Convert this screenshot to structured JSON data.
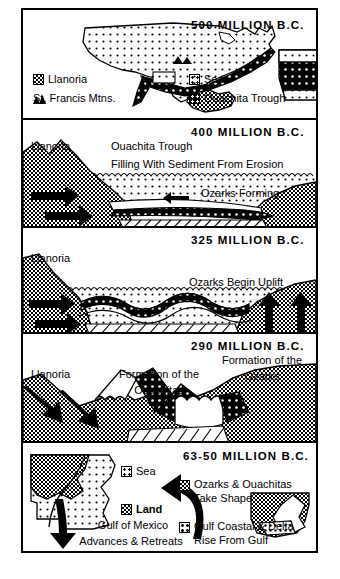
{
  "figure": {
    "accent_color": "#000000",
    "background_color": "#ffffff"
  },
  "panels": [
    {
      "id": "panel-500",
      "era": "500  MILLION  B.C.",
      "legend": [
        {
          "swatch": "gray-stipple",
          "label": "Llanoria"
        },
        {
          "swatch": "mountain-triangles",
          "label": "St. Francis Mtns."
        },
        {
          "swatch": "sea-dots",
          "label": "Sea"
        },
        {
          "swatch": "dark-trough",
          "label": "Ouachita Trough"
        }
      ],
      "maps": [
        {
          "name": "united-states-map",
          "fills": [
            "Sea",
            "Ouachita Trough",
            "Llanoria",
            "St. Francis Mtns."
          ]
        },
        {
          "name": "arkansas-inset-map",
          "fills": [
            "Sea",
            "Ouachita Trough"
          ]
        }
      ]
    },
    {
      "id": "panel-400",
      "era": "400  MILLION  B.C.",
      "labels": [
        {
          "name": "llanoria-label",
          "text": "Llanoria"
        },
        {
          "name": "trough-label-line1",
          "text": "Ouachita Trough"
        },
        {
          "name": "trough-label-line2",
          "text": "Filling With Sediment From Erosion"
        },
        {
          "name": "ozarks-forming-label",
          "text": "Ozarks Forming"
        }
      ]
    },
    {
      "id": "panel-325",
      "era": "325  MILLION  B.C.",
      "labels": [
        {
          "name": "llanoria-label",
          "text": "Llanoria"
        },
        {
          "name": "ozarks-uplift-label",
          "text": "Ozarks Begin Uplift"
        }
      ]
    },
    {
      "id": "panel-290",
      "era": "290  MILLION  B.C.",
      "labels": [
        {
          "name": "llanoria-label",
          "text": "Llanoria"
        },
        {
          "name": "ouachitas-label-line1",
          "text": "Formation of the"
        },
        {
          "name": "ouachitas-label-line2",
          "text": "Ouachitas"
        },
        {
          "name": "ozarks-label-line1",
          "text": "Formation of the"
        },
        {
          "name": "ozarks-label-line2",
          "text": "Ozarks"
        }
      ]
    },
    {
      "id": "panel-63-50",
      "era": "63-50  MILLION  B.C.",
      "legend": [
        {
          "swatch": "sea-dots",
          "label": "Sea"
        },
        {
          "swatch": "gray-stipple",
          "label": "Land"
        },
        {
          "swatch": "gray-stipple",
          "label": "Ozarks & Ouachitas\nTake Shape"
        },
        {
          "swatch": "delta-dots",
          "label": "Gulf Coastal & Delta\nRise From Gulf"
        }
      ],
      "legend_flat": {
        "sea": "Sea",
        "land": "Land",
        "ozarks_line1": "Ozarks & Ouachitas",
        "ozarks_line2": "Take Shape",
        "gulf_line1": "Gulf Coastal & Delta",
        "gulf_line2": "Rise From Gulf"
      },
      "labels": [
        {
          "name": "gulf-label-line1",
          "text": "Gulf of Mexico"
        },
        {
          "name": "gulf-label-line2",
          "text": "Advances & Retreats"
        }
      ],
      "maps": [
        {
          "name": "gulf-coast-map",
          "fills": [
            "Land",
            "Sea"
          ]
        },
        {
          "name": "arkansas-inset-map",
          "fills": [
            "Ozarks & Ouachitas",
            "Gulf Coastal & Delta"
          ]
        }
      ]
    }
  ],
  "panel1": {
    "era": "500  MILLION  B.C.",
    "legend": {
      "llanoria": "Llanoria",
      "st_francis": "St. Francis Mtns.",
      "sea": "Sea",
      "trough": "Ouachita Trough"
    }
  },
  "panel2": {
    "era": "400  MILLION  B.C.",
    "llanoria": "Llanoria",
    "trough1": "Ouachita Trough",
    "trough2": "Filling With Sediment From Erosion",
    "ozarks": "Ozarks Forming"
  },
  "panel3": {
    "era": "325  MILLION  B.C.",
    "llanoria": "Llanoria",
    "uplift": "Ozarks Begin Uplift"
  },
  "panel4": {
    "era": "290  MILLION  B.C.",
    "llanoria": "Llanoria",
    "ouachitas1": "Formation of the",
    "ouachitas2": "Ouachitas",
    "ozarks1": "Formation of the",
    "ozarks2": "Ozarks"
  },
  "panel5": {
    "era": "63-50  MILLION  B.C.",
    "sea": "Sea",
    "land": "Land",
    "ozarks1": "Ozarks & Ouachitas",
    "ozarks2": "Take Shape",
    "gulf1": "Gulf Coastal & Delta",
    "gulf2": "Rise From Gulf",
    "gom1": "Gulf of Mexico",
    "gom2": "Advances & Retreats"
  }
}
